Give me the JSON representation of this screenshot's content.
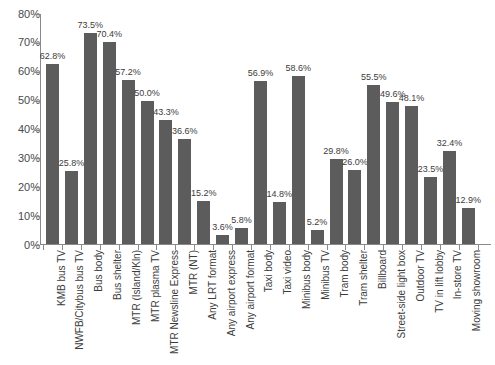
{
  "chart_data": {
    "type": "bar",
    "title": "",
    "subtitle": "",
    "xlabel": "",
    "ylabel": "",
    "ylim": [
      0,
      80
    ],
    "ytick_step": 10,
    "ytick_labels": [
      "0%",
      "10%",
      "20%",
      "30%",
      "40%",
      "50%",
      "60%",
      "70%",
      "80%"
    ],
    "ytick_values": [
      0,
      10,
      20,
      30,
      40,
      50,
      60,
      70,
      80
    ],
    "grid": false,
    "legend": false,
    "value_label_suffix": "%",
    "bar_color": "#5c5c5c",
    "axis_color": "#8a8a8a",
    "text_color": "#3c3c3c",
    "categories": [
      "KMB bus TV",
      "NWFB/Citybus bus TV",
      "Bus body",
      "Bus shelter",
      "MTR (Island/Kln)",
      "MTR plasma TV",
      "MTR Newsline Express",
      "MTR (NT)",
      "Any LRT format",
      "Any airport express",
      "Any airport format",
      "Taxi body",
      "Taxi video",
      "Minibus body",
      "Minibus TV",
      "Tram body",
      "Tram shelter",
      "Billboard",
      "Street-side light box",
      "Outdoor TV",
      "TV in lift lobby",
      "In-store TV",
      "Moving showroom"
    ],
    "values": [
      62.8,
      25.8,
      73.5,
      70.4,
      57.2,
      50.0,
      43.3,
      36.6,
      15.2,
      3.6,
      5.8,
      56.9,
      14.8,
      58.6,
      5.2,
      29.8,
      26.0,
      55.5,
      49.6,
      48.1,
      23.5,
      32.4,
      12.9
    ],
    "value_labels": [
      "62.8%",
      "25.8%",
      "73.5%",
      "70.4%",
      "57.2%",
      "50.0%",
      "43.3%",
      "36.6%",
      "15.2%",
      "3.6%",
      "5.8%",
      "56.9%",
      "14.8%",
      "58.6%",
      "5.2%",
      "29.8%",
      "26.0%",
      "55.5%",
      "49.6%",
      "48.1%",
      "23.5%",
      "32.4%",
      "12.9%"
    ]
  }
}
